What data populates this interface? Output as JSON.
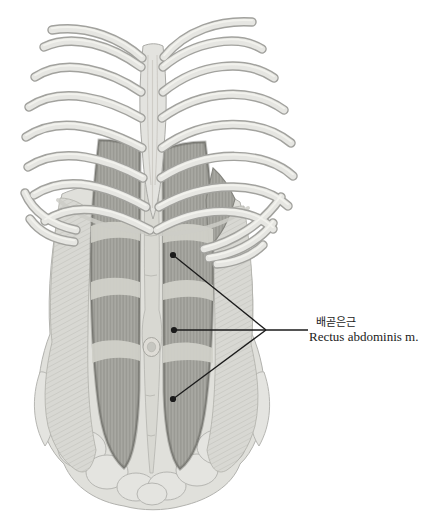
{
  "figure": {
    "labels": {
      "korean": "배곧은근",
      "latin": "Rectus abdominis m."
    },
    "annotation": {
      "pointer_count": 3,
      "ink": "#1b1b1b"
    },
    "colors": {
      "background": "#ffffff",
      "bone": "#e6e6e2",
      "bone_outline": "#a2a29e",
      "muscle": "#a8a8a2",
      "muscle_fiber": "#8f8f89",
      "tendon_band": "#d1d1ca",
      "linea_alba": "#d8d8d2",
      "flank": "#d8d8d3",
      "pelvis": "#e4e4e0"
    }
  }
}
